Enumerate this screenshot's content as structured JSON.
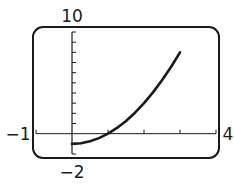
{
  "chart_data": {
    "type": "line",
    "title": "",
    "xlabel": "",
    "ylabel": "",
    "xlim": [
      -1,
      4
    ],
    "ylim": [
      -2,
      10
    ],
    "xscale": 1,
    "yscale": 1,
    "grid": false,
    "window_labels": {
      "xmin": "−1",
      "xmax": "4",
      "ymin": "−2",
      "ymax": "10"
    },
    "x_ticks": [
      -1,
      0,
      1,
      2,
      3,
      4
    ],
    "y_ticks": [
      -2,
      -1,
      0,
      1,
      2,
      3,
      4,
      5,
      6,
      7,
      8,
      9,
      10
    ],
    "series": [
      {
        "name": "f(x) = x^2 - 1",
        "domain": [
          0,
          3
        ],
        "x": [
          0,
          0.25,
          0.5,
          0.75,
          1,
          1.25,
          1.5,
          1.75,
          2,
          2.25,
          2.5,
          2.75,
          3
        ],
        "values": [
          -1,
          -0.9375,
          -0.75,
          -0.4375,
          0,
          0.5625,
          1.25,
          2.0625,
          3,
          4.0625,
          5.25,
          6.5625,
          8
        ]
      }
    ]
  },
  "colors": {
    "ink": "#1a1a1a",
    "background": "#ffffff"
  }
}
